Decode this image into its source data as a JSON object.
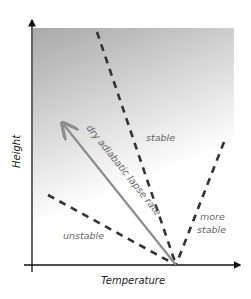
{
  "diagram": {
    "axes": {
      "x_label": "Temperature",
      "y_label": "Height"
    },
    "lines": [
      {
        "name": "unstable",
        "style": "dashed",
        "label": "unstable"
      },
      {
        "name": "dry-adiabatic-lapse-rate",
        "style": "solid-arrow",
        "label": "dry adiabatic lapse rate"
      },
      {
        "name": "stable",
        "style": "dashed",
        "label": "stable"
      },
      {
        "name": "more-stable",
        "style": "dashed",
        "label_line1": "more",
        "label_line2": "stable"
      }
    ],
    "colors": {
      "gradient_top": "#a9a9a9",
      "gradient_bottom": "#ffffff",
      "dashed": "#333333",
      "dalr": "#8c8c8c",
      "label": "#666666"
    }
  }
}
